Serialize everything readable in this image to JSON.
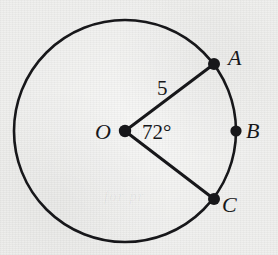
{
  "figure": {
    "kind": "circle-geometry-diagram",
    "background_color": "#efefed",
    "ink_color": "#17171a",
    "canvas": {
      "width": 278,
      "height": 255
    },
    "circle": {
      "center_label": "O",
      "center_x": 125,
      "center_y": 131,
      "radius_px": 111,
      "stroke_width": 2.6
    },
    "points": [
      {
        "label": "A",
        "x": 214,
        "y": 64,
        "dot_radius": 6.0,
        "on_circle": true
      },
      {
        "label": "B",
        "x": 236,
        "y": 131,
        "dot_radius": 5.6,
        "on_circle": true
      },
      {
        "label": "C",
        "x": 214,
        "y": 199,
        "dot_radius": 6.0,
        "on_circle": true
      },
      {
        "label": "O",
        "x": 125,
        "y": 131,
        "dot_radius": 6.2,
        "on_circle": false
      }
    ],
    "segments": [
      {
        "name": "radius-OA",
        "from": "O",
        "to": "A",
        "stroke_width": 3.0
      },
      {
        "name": "radius-OC",
        "from": "O",
        "to": "C",
        "stroke_width": 3.0
      }
    ],
    "labels": {
      "center": "O",
      "point_a": "A",
      "point_b": "B",
      "point_c": "C",
      "radius_measure": "5",
      "angle_measure": "72°"
    },
    "ghost_text": "for pr"
  }
}
